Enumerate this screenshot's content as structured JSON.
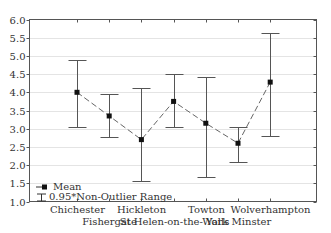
{
  "chart_data": {
    "type": "line",
    "subtype": "mean-with-range-error-bars",
    "title": "",
    "xlabel": "",
    "ylabel": "",
    "ylim": [
      1.0,
      6.0
    ],
    "yticks": [
      "1.0",
      "1.5",
      "2.0",
      "2.5",
      "3.0",
      "3.5",
      "4.0",
      "4.5",
      "5.0",
      "5.5",
      "6.0"
    ],
    "grid": true,
    "categories": [
      "Chichester",
      "Fishergate",
      "Hickleton",
      "St Helen-on-the-Walls",
      "Towton",
      "York Minster",
      "Wolverhampton"
    ],
    "series": [
      {
        "name": "Mean",
        "values": [
          4.0,
          3.35,
          2.7,
          3.75,
          3.15,
          2.6,
          4.28
        ]
      },
      {
        "name": "0.95*Non-Outlier Range upper",
        "values": [
          4.9,
          3.96,
          4.11,
          4.49,
          4.43,
          3.06,
          5.64
        ]
      },
      {
        "name": "0.95*Non-Outlier Range lower",
        "values": [
          3.04,
          2.77,
          1.55,
          3.04,
          1.66,
          2.08,
          2.8
        ]
      }
    ],
    "legend": {
      "position": "lower-left",
      "entries": [
        "Mean",
        "0.95*Non-Outlier Range"
      ]
    }
  }
}
